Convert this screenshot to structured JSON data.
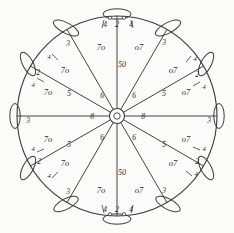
{
  "figure": {
    "ink_color": "#3a3a3a",
    "paper_color": "#fbfbf9",
    "center": {
      "x": 117,
      "y": 116
    },
    "rim_radius": 100,
    "hub_radius": 7,
    "hub_inner_radius": 3,
    "spoke_count": 12,
    "blade_count": 12,
    "labels": {
      "hub": "6",
      "hub_center": "8",
      "vertical_spoke": "50",
      "sector_right": "o7",
      "sector_left": "7o",
      "spoke_mid": "5",
      "spoke_near_hub": "6",
      "rim_horizontal": "3",
      "rim_diagonal": "2",
      "rim_tick_outer": "4",
      "rim_tick_vertical": "2",
      "blade_lead": "4",
      "spoke_end": "3",
      "axis_mark": "8"
    },
    "callouts": [
      {
        "id": "c1",
        "text": "4",
        "x": 105,
        "y": 24
      },
      {
        "id": "c2",
        "text": "2",
        "x": 117,
        "y": 24
      },
      {
        "id": "c3",
        "text": "4",
        "x": 131,
        "y": 24
      },
      {
        "id": "c4",
        "text": "7o",
        "x": 101,
        "y": 47
      },
      {
        "id": "c5",
        "text": "o7",
        "x": 137,
        "y": 47
      },
      {
        "id": "c6",
        "text": "50",
        "x": 118,
        "y": 64
      },
      {
        "id": "c7",
        "text": "3",
        "x": 68,
        "y": 43
      },
      {
        "id": "c8",
        "text": "3",
        "x": 164,
        "y": 42
      },
      {
        "id": "c9",
        "text": "4",
        "x": 49,
        "y": 57
      },
      {
        "id": "c10",
        "text": "4",
        "x": 194,
        "y": 60
      },
      {
        "id": "c11",
        "text": "7o",
        "x": 65,
        "y": 70
      },
      {
        "id": "c12",
        "text": "o7",
        "x": 172,
        "y": 70
      },
      {
        "id": "c13",
        "text": "2",
        "x": 39,
        "y": 72
      },
      {
        "id": "c14",
        "text": "2",
        "x": 196,
        "y": 74
      },
      {
        "id": "c15",
        "text": "4",
        "x": 34,
        "y": 84
      },
      {
        "id": "c16",
        "text": "4",
        "x": 203,
        "y": 86
      },
      {
        "id": "c17",
        "text": "7o",
        "x": 48,
        "y": 92
      },
      {
        "id": "c18",
        "text": "o7",
        "x": 184,
        "y": 92
      },
      {
        "id": "c19",
        "text": "5",
        "x": 69,
        "y": 93
      },
      {
        "id": "c20",
        "text": "5",
        "x": 164,
        "y": 93
      },
      {
        "id": "c21",
        "text": "6",
        "x": 101,
        "y": 95
      },
      {
        "id": "c22",
        "text": "6",
        "x": 133,
        "y": 95
      },
      {
        "id": "c23",
        "text": "3",
        "x": 29,
        "y": 120
      },
      {
        "id": "c24",
        "text": "3",
        "x": 207,
        "y": 120
      },
      {
        "id": "c25",
        "text": "8",
        "x": 92,
        "y": 117
      },
      {
        "id": "c26",
        "text": "8",
        "x": 142,
        "y": 117
      },
      {
        "id": "c27",
        "text": "6",
        "x": 101,
        "y": 137
      },
      {
        "id": "c28",
        "text": "6",
        "x": 133,
        "y": 137
      },
      {
        "id": "c29",
        "text": "7o",
        "x": 48,
        "y": 139
      },
      {
        "id": "c30",
        "text": "o7",
        "x": 184,
        "y": 139
      },
      {
        "id": "c31",
        "text": "5",
        "x": 69,
        "y": 144
      },
      {
        "id": "c32",
        "text": "5",
        "x": 164,
        "y": 144
      },
      {
        "id": "c33",
        "text": "4",
        "x": 34,
        "y": 148
      },
      {
        "id": "c34",
        "text": "4",
        "x": 203,
        "y": 148
      },
      {
        "id": "c35",
        "text": "7o",
        "x": 65,
        "y": 163
      },
      {
        "id": "c36",
        "text": "o7",
        "x": 172,
        "y": 163
      },
      {
        "id": "c37",
        "text": "2",
        "x": 40,
        "y": 161
      },
      {
        "id": "c38",
        "text": "2",
        "x": 196,
        "y": 161
      },
      {
        "id": "c39",
        "text": "4",
        "x": 49,
        "y": 175
      },
      {
        "id": "c40",
        "text": "4",
        "x": 195,
        "y": 173
      },
      {
        "id": "c41",
        "text": "50",
        "x": 118,
        "y": 172
      },
      {
        "id": "c42",
        "text": "3",
        "x": 68,
        "y": 191
      },
      {
        "id": "c43",
        "text": "3",
        "x": 164,
        "y": 191
      },
      {
        "id": "c44",
        "text": "7o",
        "x": 101,
        "y": 190
      },
      {
        "id": "c45",
        "text": "o7",
        "x": 137,
        "y": 190
      },
      {
        "id": "c46",
        "text": "4",
        "x": 105,
        "y": 210
      },
      {
        "id": "c47",
        "text": "2",
        "x": 117,
        "y": 210
      },
      {
        "id": "c48",
        "text": "4",
        "x": 131,
        "y": 210
      }
    ],
    "blades": [
      {
        "angle_deg": 270,
        "label": "blade-top"
      },
      {
        "angle_deg": 300,
        "label": "blade-upper-right"
      },
      {
        "angle_deg": 330,
        "label": "blade-right-upper"
      },
      {
        "angle_deg": 0,
        "label": "blade-right"
      },
      {
        "angle_deg": 30,
        "label": "blade-right-lower"
      },
      {
        "angle_deg": 60,
        "label": "blade-lower-right"
      },
      {
        "angle_deg": 90,
        "label": "blade-bottom"
      },
      {
        "angle_deg": 120,
        "label": "blade-lower-left"
      },
      {
        "angle_deg": 150,
        "label": "blade-left-lower"
      },
      {
        "angle_deg": 180,
        "label": "blade-left"
      },
      {
        "angle_deg": 210,
        "label": "blade-left-upper"
      },
      {
        "angle_deg": 240,
        "label": "blade-upper-left"
      }
    ]
  }
}
